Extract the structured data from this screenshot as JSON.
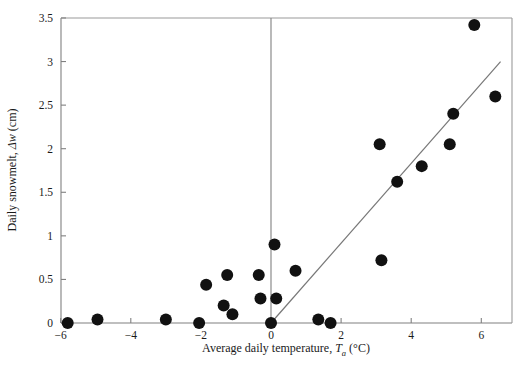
{
  "chart_data": {
    "type": "scatter",
    "title": "",
    "xlabel": "Average daily temperature, T_a (°C)",
    "ylabel": "Daily snowmelt, Δw (cm)",
    "xlabel_parts": {
      "prefix": "Average daily temperature, ",
      "symbol": "T",
      "subscript": "a",
      "units": " (°C)"
    },
    "ylabel_parts": {
      "prefix": "Daily snowmelt, ",
      "symbol": "Δw",
      "units": " (cm)"
    },
    "xlim": [
      -6.3,
      7.0
    ],
    "ylim": [
      0,
      3.5
    ],
    "xticks": [
      -6,
      -4,
      -2,
      0,
      2,
      4,
      6
    ],
    "xtick_labels": [
      "−6",
      "−4",
      "−2",
      "0",
      "2",
      "4",
      "6"
    ],
    "yticks": [
      0,
      0.5,
      1,
      1.5,
      2,
      2.5,
      3,
      3.5
    ],
    "ytick_labels": [
      "0",
      "0.5",
      "1",
      "1.5",
      "2",
      "2.5",
      "3",
      "3.5"
    ],
    "grid": false,
    "legend": null,
    "marker_color": "#111111",
    "marker_size": 6.0,
    "line_color": "#777777",
    "axis_color": "#808080",
    "points": [
      {
        "x": -5.8,
        "y": 0.0
      },
      {
        "x": -4.95,
        "y": 0.04
      },
      {
        "x": -3.0,
        "y": 0.04
      },
      {
        "x": -2.05,
        "y": 0.0
      },
      {
        "x": -1.85,
        "y": 0.44
      },
      {
        "x": -1.35,
        "y": 0.2
      },
      {
        "x": -1.25,
        "y": 0.55
      },
      {
        "x": -1.1,
        "y": 0.1
      },
      {
        "x": -0.3,
        "y": 0.28
      },
      {
        "x": -0.35,
        "y": 0.55
      },
      {
        "x": 0.0,
        "y": 0.0
      },
      {
        "x": 0.1,
        "y": 0.9
      },
      {
        "x": 0.15,
        "y": 0.28
      },
      {
        "x": 0.7,
        "y": 0.6
      },
      {
        "x": 1.35,
        "y": 0.04
      },
      {
        "x": 1.7,
        "y": 0.0
      },
      {
        "x": 3.1,
        "y": 2.05
      },
      {
        "x": 3.15,
        "y": 0.72
      },
      {
        "x": 3.6,
        "y": 1.62
      },
      {
        "x": 4.3,
        "y": 1.8
      },
      {
        "x": 5.1,
        "y": 2.05
      },
      {
        "x": 5.2,
        "y": 2.4
      },
      {
        "x": 5.8,
        "y": 3.42
      },
      {
        "x": 6.4,
        "y": 2.6
      }
    ],
    "fit_line": {
      "x0": 0.0,
      "y0": 0.0,
      "x1": 6.55,
      "y1": 3.0,
      "slope": 0.458,
      "intercept": 0.0
    },
    "vertical_reference": {
      "x": 0.0,
      "from_y": 0.0,
      "to_y": 3.5
    }
  }
}
